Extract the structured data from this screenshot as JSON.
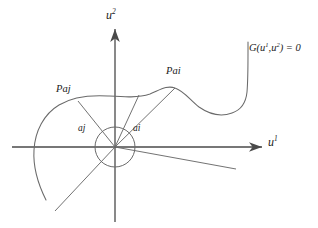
{
  "figure": {
    "kind": "mathematical-diagram",
    "background_color": "#ffffff",
    "stroke_color": "#555555",
    "axis_color": "#4a4a4a",
    "text_color": "#1a1a1a"
  },
  "axes": {
    "horizontal": {
      "name": "u1-axis",
      "label_main": "u",
      "label_exponent": "1",
      "arrow_direction": "right"
    },
    "vertical": {
      "name": "u2-axis",
      "label_main": "u",
      "label_exponent": "2",
      "arrow_direction": "up"
    }
  },
  "curve": {
    "name": "constraint-curve",
    "label_prefix": "G(",
    "label_arg1": "u",
    "label_arg1_exp": "1",
    "label_comma": ",",
    "label_arg2": "u",
    "label_arg2_exp": "2",
    "label_suffix": ") = 0",
    "label_full": "G(u1,u2) = 0"
  },
  "points": [
    {
      "name": "point-pai",
      "label": "Pai"
    },
    {
      "name": "point-paj",
      "label": "Paj"
    }
  ],
  "angles": [
    {
      "name": "angle-ai",
      "label": "ai"
    },
    {
      "name": "angle-aj",
      "label": "aj"
    }
  ],
  "origin": {
    "name": "origin-circle",
    "cx": 115,
    "cy": 147,
    "r": 20
  }
}
